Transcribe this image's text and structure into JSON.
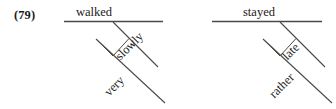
{
  "figure": {
    "example_number": "(79)",
    "background_color": "#ffffff",
    "line_color": "#4a4a4a",
    "text_color": "#1a1a1a",
    "width": 336,
    "height": 109
  },
  "diagrams": [
    {
      "id": "left",
      "verb": "walked",
      "adverb": "slowly",
      "intensifier": "very"
    },
    {
      "id": "right",
      "verb": "stayed",
      "adverb": "late",
      "intensifier": "rather"
    }
  ]
}
